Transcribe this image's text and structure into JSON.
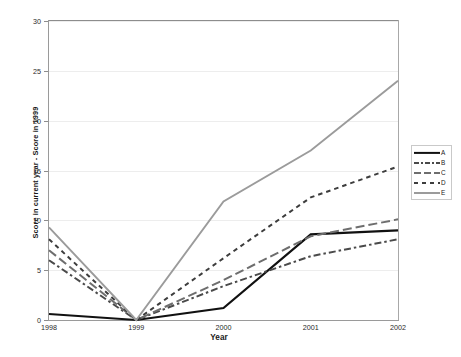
{
  "chart_data": {
    "type": "line",
    "title": "",
    "xlabel": "Year",
    "ylabel": "Score in current year - Score in 1999",
    "categories": [
      "1998",
      "1999",
      "2000",
      "2001",
      "2002"
    ],
    "x": [
      1998,
      1999,
      2000,
      2001,
      2002
    ],
    "xlim": [
      1998,
      2002
    ],
    "ylim": [
      0,
      30
    ],
    "yticks": [
      0,
      5,
      10,
      15,
      20,
      25,
      30
    ],
    "ytick_labels": [
      "0",
      "5",
      "10",
      "15",
      "20",
      "25",
      "30"
    ],
    "grid": "horizontal",
    "legend_position": "right",
    "series": [
      {
        "name": "A",
        "style": "solid",
        "color": "#111111",
        "width": 2.2,
        "values": [
          0.6,
          0.0,
          1.2,
          8.6,
          9.0
        ]
      },
      {
        "name": "B",
        "style": "dash-dot",
        "color": "#4a4a4a",
        "width": 2.0,
        "values": [
          6.0,
          0.0,
          3.4,
          6.4,
          8.1
        ]
      },
      {
        "name": "C",
        "style": "long-dash",
        "color": "#6e6e6e",
        "width": 2.0,
        "values": [
          7.0,
          0.0,
          4.0,
          8.4,
          10.1
        ]
      },
      {
        "name": "D",
        "style": "short-dash",
        "color": "#3d3d3d",
        "width": 2.0,
        "values": [
          8.1,
          0.0,
          6.2,
          12.3,
          15.4
        ]
      },
      {
        "name": "E",
        "style": "solid",
        "color": "#9b9b9b",
        "width": 1.9,
        "values": [
          9.3,
          0.0,
          11.9,
          17.0,
          24.0
        ]
      }
    ]
  },
  "axes": {
    "y_title": "Score in current year - Score in 1999",
    "x_title": "Year",
    "y_labels": [
      "30",
      "25",
      "20",
      "15",
      "10",
      "5",
      "0"
    ],
    "x_labels": [
      "1998",
      "1999",
      "2000",
      "2001",
      "2002"
    ]
  },
  "legend": {
    "items": [
      {
        "label": "A"
      },
      {
        "label": "B"
      },
      {
        "label": "C"
      },
      {
        "label": "D"
      },
      {
        "label": "E"
      }
    ]
  },
  "caption": {
    "text": ""
  }
}
